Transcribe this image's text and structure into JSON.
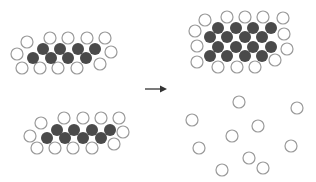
{
  "colors": {
    "background": "#ffffff",
    "empty_stroke": "#9a9a9a",
    "filled": "#4a4a4a",
    "arrow": "#333333"
  },
  "circle_radius": 6,
  "groups": [
    {
      "name": "top-left-cluster",
      "filled": [
        [
          43,
          49
        ],
        [
          60,
          49
        ],
        [
          78,
          49
        ],
        [
          95,
          49
        ],
        [
          33,
          58
        ],
        [
          51,
          58
        ],
        [
          68,
          58
        ],
        [
          86,
          58
        ]
      ],
      "empty": [
        [
          50,
          38
        ],
        [
          68,
          38
        ],
        [
          87,
          38
        ],
        [
          105,
          38
        ],
        [
          27,
          42
        ],
        [
          17,
          54
        ],
        [
          111,
          52
        ],
        [
          22,
          68
        ],
        [
          40,
          68
        ],
        [
          58,
          68
        ],
        [
          77,
          68
        ],
        [
          100,
          64
        ]
      ]
    },
    {
      "name": "bottom-left-cluster",
      "filled": [
        [
          57,
          130
        ],
        [
          74,
          130
        ],
        [
          92,
          130
        ],
        [
          110,
          130
        ],
        [
          47,
          138
        ],
        [
          65,
          138
        ],
        [
          83,
          138
        ],
        [
          101,
          138
        ]
      ],
      "empty": [
        [
          64,
          118
        ],
        [
          83,
          118
        ],
        [
          101,
          118
        ],
        [
          119,
          118
        ],
        [
          41,
          123
        ],
        [
          30,
          136
        ],
        [
          123,
          132
        ],
        [
          37,
          148
        ],
        [
          55,
          148
        ],
        [
          73,
          148
        ],
        [
          92,
          148
        ],
        [
          114,
          144
        ]
      ]
    },
    {
      "name": "top-right-cluster",
      "filled": [
        [
          218,
          28
        ],
        [
          236,
          28
        ],
        [
          253,
          28
        ],
        [
          271,
          28
        ],
        [
          210,
          37
        ],
        [
          227,
          37
        ],
        [
          245,
          37
        ],
        [
          262,
          37
        ],
        [
          218,
          47
        ],
        [
          236,
          47
        ],
        [
          253,
          47
        ],
        [
          271,
          47
        ],
        [
          210,
          56
        ],
        [
          227,
          56
        ],
        [
          245,
          56
        ],
        [
          262,
          56
        ]
      ],
      "empty": [
        [
          227,
          17
        ],
        [
          245,
          17
        ],
        [
          263,
          17
        ],
        [
          283,
          18
        ],
        [
          205,
          20
        ],
        [
          195,
          31
        ],
        [
          197,
          46
        ],
        [
          197,
          62
        ],
        [
          284,
          34
        ],
        [
          287,
          49
        ],
        [
          275,
          60
        ],
        [
          218,
          67
        ],
        [
          237,
          67
        ],
        [
          255,
          67
        ]
      ]
    },
    {
      "name": "bottom-right-scattered",
      "filled": [],
      "empty": [
        [
          239,
          102
        ],
        [
          297,
          108
        ],
        [
          192,
          120
        ],
        [
          258,
          126
        ],
        [
          232,
          136
        ],
        [
          291,
          146
        ],
        [
          199,
          148
        ],
        [
          249,
          158
        ],
        [
          263,
          168
        ],
        [
          222,
          170
        ]
      ]
    }
  ],
  "arrow": {
    "x1": 145,
    "y1": 89,
    "x2": 167,
    "y2": 89,
    "label": ""
  }
}
